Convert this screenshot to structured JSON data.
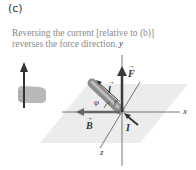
{
  "panel": {
    "label": "(c)",
    "caption": "Reversing the current [relative to (b)] reverses the force direction."
  },
  "diagram": {
    "axes": {
      "x": "x",
      "y": "y",
      "z": "z"
    },
    "vectors": {
      "force": "F",
      "length": "l",
      "field": "B",
      "current": "I"
    },
    "angle": "φ",
    "arrow_glyph": "→"
  },
  "colors": {
    "plane": "#e6e6e6",
    "axis": "#444444",
    "force_arrow": "#3a3a3a",
    "conductor": "#9a9a9a",
    "hand": "#b5b5b5",
    "caption": "#8a8a8a"
  }
}
